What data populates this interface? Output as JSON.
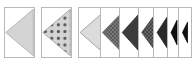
{
  "figure": {
    "type": "triangle-marker-strip",
    "background_color": "#ffffff",
    "cell_border_color": "#b8b8b8",
    "canvas": {
      "width": 196,
      "height": 65
    }
  },
  "palette": {
    "light_gray": "#d4d4d4",
    "mid_gray": "#9a9a9a",
    "dark_gray": "#3c3c3c",
    "darker_gray": "#2a2a2a",
    "black": "#111111",
    "outline_gray": "#8c8c8c",
    "dot_color": "#555555",
    "white": "#ffffff"
  },
  "cells": [
    {
      "name": "cell-1-light-triangle",
      "x": 4,
      "y": 7,
      "width": 31,
      "height": 51,
      "marker": {
        "fill_style": "solid",
        "fill": "#d4d4d4",
        "stroke": "#a8a8a8",
        "direction": "left",
        "size_ratio": 0.95
      }
    },
    {
      "name": "cell-2-dotted-triangle",
      "x": 41,
      "y": 7,
      "width": 31,
      "height": 51,
      "marker": {
        "fill_style": "dots",
        "fill": "#d4d4d4",
        "stroke": "#9a9a9a",
        "dot_color": "#555555",
        "direction": "left",
        "size_ratio": 0.95
      }
    },
    {
      "name": "cell-3-outline-triangle",
      "x": 78,
      "y": 7,
      "width": 30,
      "height": 51,
      "marker": {
        "fill_style": "solid",
        "fill": "#dcdcdc",
        "stroke": "#8c8c8c",
        "direction": "left",
        "size_ratio": 0.92
      }
    },
    {
      "name": "cell-4-checkered-triangle",
      "x": 100,
      "y": 7,
      "width": 26,
      "height": 51,
      "marker": {
        "fill_style": "checker",
        "fill": "#7e7e7e",
        "stroke": "#555555",
        "direction": "left",
        "size_ratio": 0.88
      }
    },
    {
      "name": "cell-5-dark-triangle",
      "x": 119,
      "y": 7,
      "width": 24,
      "height": 51,
      "marker": {
        "fill_style": "solid",
        "fill": "#3c3c3c",
        "stroke": "#2f2f2f",
        "direction": "left",
        "size_ratio": 0.8
      }
    },
    {
      "name": "cell-6-textured-triangle",
      "x": 138,
      "y": 7,
      "width": 20,
      "height": 51,
      "marker": {
        "fill_style": "checker",
        "fill": "#6e6e6e",
        "stroke": "#3c3c3c",
        "direction": "left",
        "size_ratio": 0.7
      }
    },
    {
      "name": "cell-7-dark-triangle-small",
      "x": 153,
      "y": 7,
      "width": 18,
      "height": 51,
      "marker": {
        "fill_style": "solid",
        "fill": "#2a2a2a",
        "stroke": "#1f1f1f",
        "direction": "left",
        "size_ratio": 0.62
      }
    },
    {
      "name": "cell-8-black-triangle-tiny",
      "x": 167,
      "y": 7,
      "width": 14,
      "height": 51,
      "marker": {
        "fill_style": "solid",
        "fill": "#111111",
        "stroke": "#000000",
        "direction": "left",
        "size_ratio": 0.5
      }
    },
    {
      "name": "cell-9-black-triangle-smallest",
      "x": 178,
      "y": 7,
      "width": 14,
      "height": 51,
      "marker": {
        "fill_style": "solid",
        "fill": "#111111",
        "stroke": "#000000",
        "direction": "left",
        "size_ratio": 0.42
      }
    }
  ]
}
